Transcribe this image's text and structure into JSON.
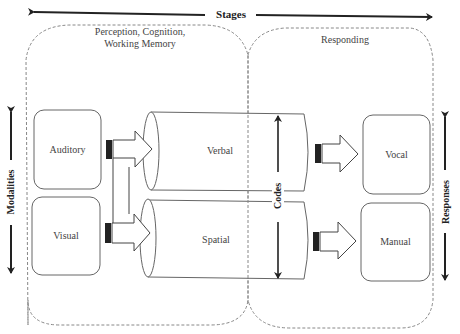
{
  "diagram": {
    "stages_label": "Stages",
    "modalities_label": "Modalities",
    "responses_label": "Responses",
    "codes_label": "Codes",
    "regions": [
      {
        "id": "perception",
        "label_line1": "Perception, Cognition,",
        "label_line2": "Working Memory"
      },
      {
        "id": "responding",
        "label": "Responding"
      }
    ],
    "inputs": [
      {
        "label": "Auditory"
      },
      {
        "label": "Visual"
      }
    ],
    "codes": [
      {
        "label": "Verbal"
      },
      {
        "label": "Spatial"
      }
    ],
    "outputs": [
      {
        "label": "Vocal"
      },
      {
        "label": "Manual"
      }
    ]
  }
}
